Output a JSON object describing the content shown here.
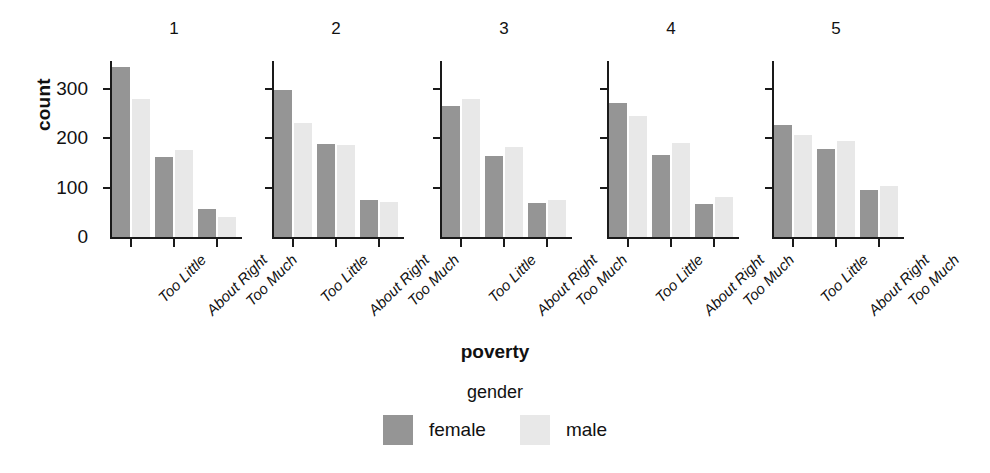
{
  "axis": {
    "y_label": "count",
    "y_ticks": [
      "0",
      "100",
      "200",
      "300"
    ],
    "x_label": "poverty",
    "x_categories": [
      "Too Little",
      "About Right",
      "Too Much"
    ]
  },
  "legend": {
    "title": "gender",
    "items": [
      {
        "label": "female",
        "color": "#959595"
      },
      {
        "label": "male",
        "color": "#e8e8e8"
      }
    ]
  },
  "panels": [
    {
      "title": "1"
    },
    {
      "title": "2"
    },
    {
      "title": "3"
    },
    {
      "title": "4"
    },
    {
      "title": "5"
    }
  ],
  "chart_data": {
    "type": "bar",
    "title": "",
    "subtitle": "",
    "xlabel": "poverty",
    "ylabel": "count",
    "ylim": [
      0,
      360
    ],
    "grid": false,
    "legend_position": "bottom",
    "legend_title": "gender",
    "facet_variable": "",
    "facets": [
      "1",
      "2",
      "3",
      "4",
      "5"
    ],
    "categories": [
      "Too Little",
      "About Right",
      "Too Much"
    ],
    "series": [
      {
        "name": "female",
        "color": "#959595",
        "values_by_facet": {
          "1": [
            345,
            163,
            57
          ],
          "2": [
            298,
            189,
            76
          ],
          "3": [
            266,
            165,
            69
          ],
          "4": [
            272,
            166,
            67
          ],
          "5": [
            228,
            179,
            95
          ]
        }
      },
      {
        "name": "male",
        "color": "#e8e8e8",
        "values_by_facet": {
          "1": [
            279,
            176,
            41
          ],
          "2": [
            232,
            186,
            70
          ],
          "3": [
            279,
            182,
            75
          ],
          "4": [
            245,
            190,
            81
          ],
          "5": [
            207,
            195,
            104
          ]
        }
      }
    ]
  }
}
